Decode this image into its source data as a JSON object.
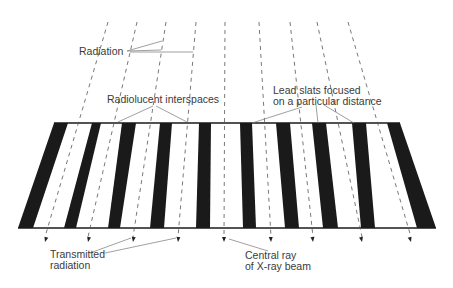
{
  "diagram": {
    "labels": {
      "radiation": "Radiation",
      "radiolucent": "Radiolucent interspaces",
      "lead_line1": "Lead slats focused",
      "lead_line2": "on a particular distance",
      "transmitted_line1": "Transmitted",
      "transmitted_line2": "radiation",
      "central_line1": "Central ray",
      "central_line2": "of X-ray beam"
    },
    "colors": {
      "slat": "#1a1a1a",
      "ray": "#555555",
      "leader": "#777777",
      "text": "#3a3a3a",
      "background": "#ffffff"
    },
    "grid": {
      "top_y": 123,
      "bottom_y": 228,
      "slat_count": 10
    },
    "rays": {
      "count": 9,
      "top_x": [
        108,
        137,
        166,
        196,
        225,
        259,
        290,
        317,
        348
      ],
      "bottom_x": [
        45,
        88,
        133,
        178,
        224,
        271,
        313,
        362,
        411
      ]
    }
  }
}
